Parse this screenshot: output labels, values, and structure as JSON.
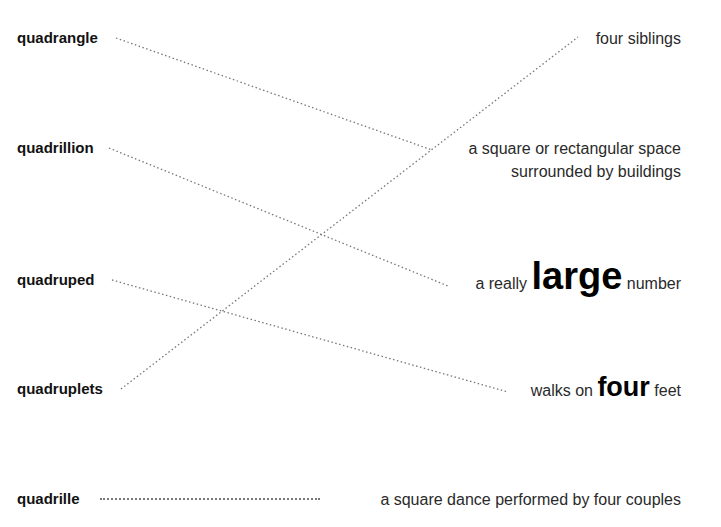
{
  "terms": [
    {
      "word": "quadrangle",
      "definition": "a square or rectangular space surrounded by buildings"
    },
    {
      "word": "quadrillion",
      "definition": "a really large number"
    },
    {
      "word": "quadruped",
      "definition": "walks on four feet"
    },
    {
      "word": "quadruplets",
      "definition": "four siblings"
    },
    {
      "word": "quadrille",
      "definition": "a square dance performed by four couples"
    }
  ],
  "labels": {
    "t0": "quadrangle",
    "t1": "quadrillion",
    "t2": "quadruped",
    "t3": "quadruplets",
    "t4": "quadrille",
    "d_siblings": "four siblings",
    "d_square_1": "a square or rectangular space",
    "d_square_2": "surrounded by buildings",
    "d_large_pre": "a really",
    "d_large_big": "large",
    "d_large_post": "number",
    "d_walks_pre": "walks on",
    "d_walks_big": "four",
    "d_walks_post": "feet",
    "d_dance": "a square dance performed by four couples"
  },
  "colors": {
    "text": "#1a1a1a",
    "dots": "#777777",
    "background": "#ffffff"
  }
}
